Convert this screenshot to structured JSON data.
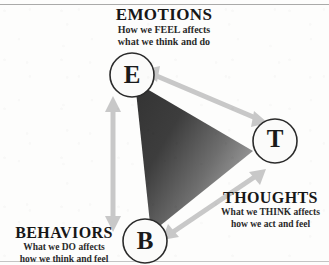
{
  "diagram": {
    "type": "cbt-triangle",
    "background_color": "#fdfdfc",
    "triangle_fill_dark": "#3a3a3a",
    "triangle_fill_light": "#9e9e9e",
    "arrow_color": "#c9c9c9",
    "node_outline_color": "#2b2b2b",
    "text_color": "#171717",
    "corners": [
      {
        "id": "emotions",
        "letter": "E",
        "title": "EMOTIONS",
        "subtitle_line1": "How we FEEL affects",
        "subtitle_line2": "what we think and do",
        "emphasis_word": "FEEL"
      },
      {
        "id": "thoughts",
        "letter": "T",
        "title": "THOUGHTS",
        "subtitle_line1": "What we THINK affects",
        "subtitle_line2": "how we act and feel",
        "emphasis_word": "THINK"
      },
      {
        "id": "behaviors",
        "letter": "B",
        "title": "BEHAVIORS",
        "subtitle_line1": "What we DO affects",
        "subtitle_line2": "how we think and feel",
        "emphasis_word": "DO"
      }
    ],
    "connections": [
      {
        "id": "emotions-thoughts",
        "from": "E",
        "to": "T",
        "style": "double-headed-arrow"
      },
      {
        "id": "emotions-behaviors",
        "from": "E",
        "to": "B",
        "style": "double-headed-arrow"
      },
      {
        "id": "behaviors-thoughts",
        "from": "B",
        "to": "T",
        "style": "double-headed-arrow"
      }
    ]
  }
}
